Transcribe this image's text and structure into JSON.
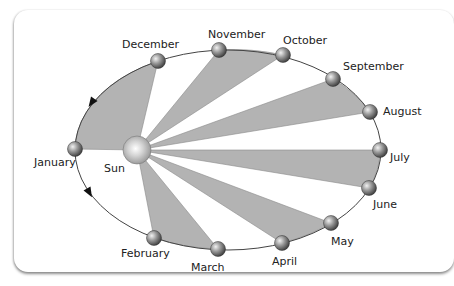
{
  "diagram": {
    "type": "kepler-second-law-orbit",
    "orbit": {
      "cx": 228,
      "cy": 150,
      "rx": 153,
      "ry": 100,
      "stroke": "#444444"
    },
    "sun": {
      "label": "Sun",
      "x": 137,
      "y": 150,
      "r": 14,
      "label_x": 104,
      "label_y": 172
    },
    "wedge_color": "#b3b3b3",
    "wedge_pairs": [
      [
        "December",
        "January"
      ],
      [
        "October",
        "November"
      ],
      [
        "August",
        "September"
      ],
      [
        "June",
        "July"
      ],
      [
        "April",
        "May"
      ],
      [
        "February",
        "March"
      ]
    ],
    "months": [
      {
        "name": "January",
        "x": 75,
        "y": 149,
        "label_x": 34,
        "label_y": 166
      },
      {
        "name": "February",
        "x": 154,
        "y": 238,
        "label_x": 121,
        "label_y": 257
      },
      {
        "name": "March",
        "x": 218,
        "y": 249,
        "label_x": 191,
        "label_y": 271
      },
      {
        "name": "April",
        "x": 282,
        "y": 243,
        "label_x": 272,
        "label_y": 265
      },
      {
        "name": "May",
        "x": 331,
        "y": 223,
        "label_x": 331,
        "label_y": 245
      },
      {
        "name": "June",
        "x": 369,
        "y": 188,
        "label_x": 373,
        "label_y": 208
      },
      {
        "name": "July",
        "x": 380,
        "y": 150,
        "label_x": 390,
        "label_y": 161
      },
      {
        "name": "August",
        "x": 370,
        "y": 112,
        "label_x": 383,
        "label_y": 115
      },
      {
        "name": "September",
        "x": 333,
        "y": 79,
        "label_x": 343,
        "label_y": 70
      },
      {
        "name": "October",
        "x": 283,
        "y": 55,
        "label_x": 283,
        "label_y": 44
      },
      {
        "name": "November",
        "x": 219,
        "y": 50,
        "label_x": 208,
        "label_y": 38
      },
      {
        "name": "December",
        "x": 158,
        "y": 61,
        "label_x": 122,
        "label_y": 48
      }
    ],
    "arrows": [
      {
        "x": 92,
        "y": 102,
        "angle": 125
      },
      {
        "x": 89,
        "y": 192,
        "angle": 60
      }
    ]
  }
}
